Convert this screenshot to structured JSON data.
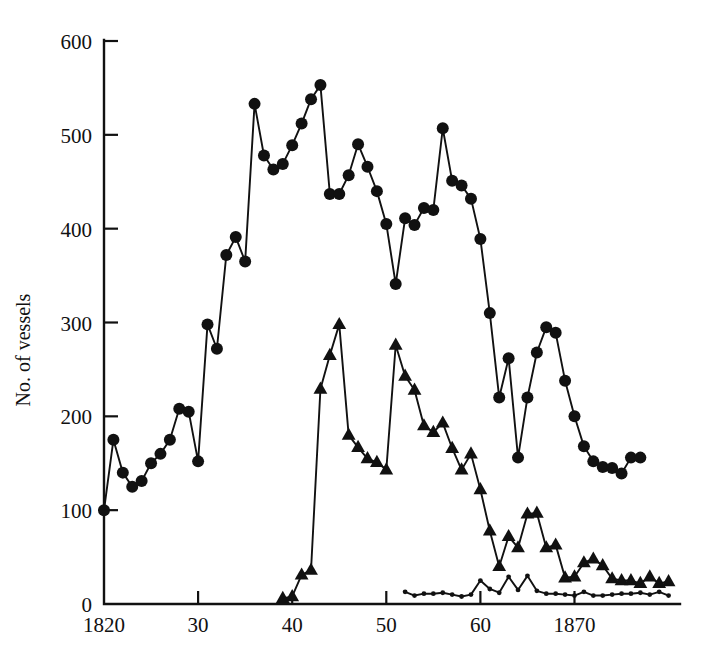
{
  "figure": {
    "background_color": "#ffffff",
    "ink_color": "#111111"
  },
  "chart_data": {
    "type": "line",
    "title": "",
    "subtitle": "",
    "xlabel": "",
    "ylabel": "No. of vessels",
    "xlim": [
      1820,
      1881
    ],
    "ylim": [
      0,
      600
    ],
    "grid": false,
    "legend_position": "none",
    "x_tick_values": [
      1820,
      1830,
      1840,
      1850,
      1860,
      1870
    ],
    "x_tick_labels": [
      "1820",
      "30",
      "40",
      "50",
      "60",
      "1870"
    ],
    "y_tick_values": [
      0,
      100,
      200,
      300,
      400,
      500,
      600
    ],
    "y_tick_labels": [
      "0",
      "100",
      "200",
      "300",
      "400",
      "500",
      "600"
    ],
    "series": [
      {
        "name": "total vessels",
        "marker": "circle",
        "marker_size": 6.0,
        "x": [
          1820,
          1821,
          1822,
          1823,
          1824,
          1825,
          1826,
          1827,
          1828,
          1829,
          1830,
          1831,
          1832,
          1833,
          1834,
          1835,
          1836,
          1837,
          1838,
          1839,
          1840,
          1841,
          1842,
          1843,
          1844,
          1845,
          1846,
          1847,
          1848,
          1849,
          1850,
          1851,
          1852,
          1853,
          1854,
          1855,
          1856,
          1857,
          1858,
          1859,
          1860,
          1861,
          1862,
          1863,
          1864,
          1865,
          1866,
          1867,
          1868,
          1869,
          1870,
          1871,
          1872,
          1873,
          1874,
          1875,
          1876,
          1877,
          1878,
          1879,
          1880
        ],
        "values": [
          100,
          175,
          140,
          125,
          131,
          150,
          160,
          175,
          208,
          205,
          152,
          298,
          272,
          372,
          391,
          365,
          533,
          478,
          463,
          469,
          489,
          512,
          538,
          553,
          437,
          437,
          457,
          490,
          466,
          440,
          405,
          341,
          411,
          404,
          422,
          420,
          507,
          451,
          446,
          432,
          389,
          310,
          220,
          262,
          156,
          220,
          268,
          295,
          289,
          238,
          200,
          168,
          152,
          146,
          145,
          139,
          156,
          156,
          null,
          null,
          null
        ]
      },
      {
        "name": "whaling vessels",
        "marker": "triangle",
        "marker_size": 6.0,
        "x": [
          1839,
          1840,
          1841,
          1842,
          1843,
          1844,
          1845,
          1846,
          1847,
          1848,
          1849,
          1850,
          1851,
          1852,
          1853,
          1854,
          1855,
          1856,
          1857,
          1858,
          1859,
          1860,
          1861,
          1862,
          1863,
          1864,
          1865,
          1866,
          1867,
          1868,
          1869,
          1870,
          1871,
          1872,
          1873,
          1874,
          1875,
          1876,
          1877,
          1878,
          1879,
          1880
        ],
        "values": [
          6,
          8,
          31,
          36,
          229,
          265,
          298,
          180,
          167,
          155,
          151,
          143,
          276,
          243,
          228,
          190,
          183,
          193,
          166,
          143,
          160,
          122,
          78,
          40,
          72,
          60,
          96,
          97,
          60,
          63,
          28,
          29,
          44,
          48,
          41,
          27,
          25,
          25,
          22,
          29,
          22,
          24
        ]
      },
      {
        "name": "other vessels",
        "marker": "small-dot",
        "marker_size": 2.4,
        "x": [
          1852,
          1853,
          1854,
          1855,
          1856,
          1857,
          1858,
          1859,
          1860,
          1861,
          1862,
          1863,
          1864,
          1865,
          1866,
          1867,
          1868,
          1869,
          1870,
          1871,
          1872,
          1873,
          1874,
          1875,
          1876,
          1877,
          1878,
          1879,
          1880
        ],
        "values": [
          13,
          9,
          11,
          11,
          12,
          10,
          8,
          10,
          25,
          16,
          12,
          29,
          15,
          30,
          14,
          11,
          11,
          10,
          9,
          13,
          9,
          9,
          10,
          11,
          11,
          12,
          10,
          13,
          9
        ]
      }
    ]
  }
}
